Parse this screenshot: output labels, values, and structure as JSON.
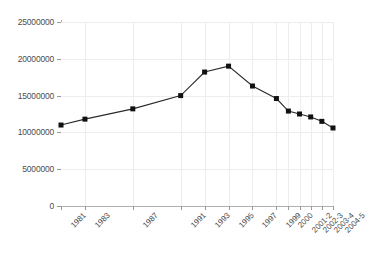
{
  "chart_data": {
    "type": "line",
    "title": "",
    "subtitle": "",
    "xlabel": "",
    "ylabel": "",
    "categories": [
      "1981",
      "1983",
      "1987",
      "1991",
      "1993",
      "1995",
      "1997",
      "1999",
      "2000",
      "2001-2",
      "2002-3",
      "2003-4",
      "2004-5"
    ],
    "values": [
      11000000,
      11800000,
      13200000,
      15000000,
      18200000,
      19000000,
      16300000,
      14600000,
      12900000,
      12500000,
      12100000,
      11500000,
      10600000
    ],
    "series": [
      {
        "name": "series-1",
        "values": [
          11000000,
          11800000,
          13200000,
          15000000,
          18200000,
          19000000,
          16300000,
          14600000,
          12900000,
          12500000,
          12100000,
          11500000,
          10600000
        ]
      }
    ],
    "x_tick_labels": [
      "1981",
      "1983",
      "1987",
      "1991",
      "1993",
      "1995",
      "1997",
      "1999",
      "2000",
      "2001-2",
      "2002-3",
      "2003-4",
      "2004-5"
    ],
    "x_tick_positions": [
      0,
      0.088,
      0.264,
      0.44,
      0.528,
      0.616,
      0.704,
      0.792,
      0.836,
      0.877,
      0.918,
      0.959,
      1.0
    ],
    "y_tick_labels": [
      "0",
      "5000000",
      "10000000",
      "15000000",
      "20000000",
      "25000000"
    ],
    "y_ticks": [
      0,
      5000000,
      10000000,
      15000000,
      20000000,
      25000000
    ],
    "ylim": [
      0,
      25000000
    ],
    "grid": true,
    "grid_color": "#ededed",
    "legend": false,
    "legend_position": "none",
    "line_color": "#2b2b2b",
    "marker_color": "#111111",
    "marker_style": "square",
    "axis_color": "#b0b0b0",
    "background_color": "#ffffff",
    "annotations": []
  }
}
